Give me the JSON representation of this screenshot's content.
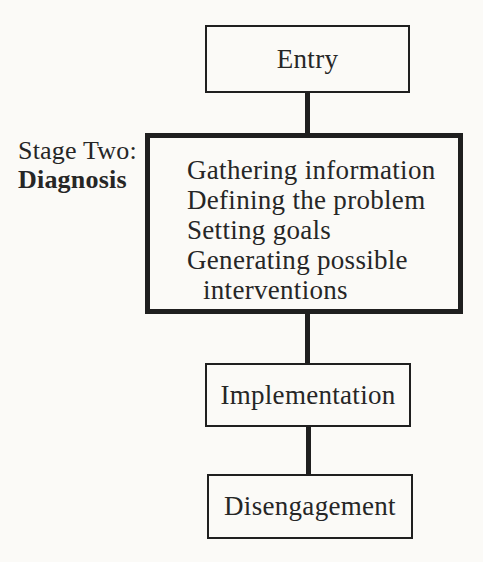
{
  "diagram": {
    "stage_label": {
      "line1": "Stage Two:",
      "line2": "Diagnosis"
    },
    "nodes": {
      "entry": "Entry",
      "implementation": "Implementation",
      "disengagement": "Disengagement"
    },
    "diagnosis_lines": [
      "Gathering information",
      "Defining the problem",
      "Setting goals",
      "Generating possible",
      "interventions"
    ],
    "flow_order": "Entry -> Diagnosis -> Implementation -> Disengagement"
  },
  "colors": {
    "background": "#fbfaf7",
    "line": "#1f1f1f",
    "text": "#262626"
  }
}
